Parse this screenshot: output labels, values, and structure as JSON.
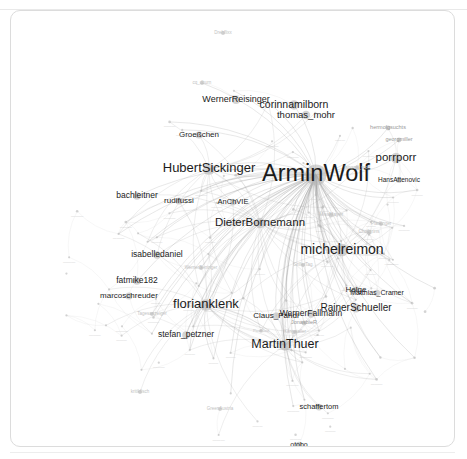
{
  "app": {
    "title": "Twitter mention network graph",
    "panel_name": "graph-canvas",
    "background_color": "#ffffff",
    "node_color": "#b9b9b9",
    "edge_color": "#8d8d8d",
    "label_color": "#1b1b1b",
    "border_color": "#dcdcdc"
  },
  "chart_data": {
    "type": "scatter",
    "subtype": "force-directed-network",
    "title": "",
    "subtitle": "",
    "xlabel": "",
    "ylabel": "",
    "grid": false,
    "legend": "none",
    "xlim": [
      0,
      443
    ],
    "ylim": [
      0,
      435
    ],
    "node_count": 148,
    "label_size_units": "px",
    "nodes": [
      {
        "id": "ArminWolf",
        "label": "ArminWolf",
        "x": 305,
        "y": 164,
        "size": 23.5,
        "tier": "major",
        "weight": 100
      },
      {
        "id": "michelreimon",
        "label": "michelreimon",
        "x": 331,
        "y": 239,
        "size": 14.0,
        "tier": "major",
        "weight": 72
      },
      {
        "id": "HubertSickinger",
        "label": "HubertSickinger",
        "x": 198,
        "y": 158,
        "size": 13.0,
        "tier": "major",
        "weight": 68
      },
      {
        "id": "florianklenk",
        "label": "florianklenk",
        "x": 195,
        "y": 294,
        "size": 13.0,
        "tier": "major",
        "weight": 67
      },
      {
        "id": "MartinThuer",
        "label": "MartinThuer",
        "x": 274,
        "y": 334,
        "size": 12.5,
        "tier": "major",
        "weight": 64
      },
      {
        "id": "DieterBornemann",
        "label": "DieterBornemann",
        "x": 249,
        "y": 212,
        "size": 11.5,
        "tier": "major",
        "weight": 58
      },
      {
        "id": "porrporr",
        "label": "porrporr",
        "x": 385,
        "y": 147,
        "size": 11.5,
        "tier": "major",
        "weight": 55
      },
      {
        "id": "corinnamilborn",
        "label": "corinnamilborn",
        "x": 283,
        "y": 94,
        "size": 10.5,
        "tier": "major",
        "weight": 53
      },
      {
        "id": "RainerSchueller",
        "label": "RainerSchueller",
        "x": 345,
        "y": 297,
        "size": 10.0,
        "tier": "major",
        "weight": 49
      },
      {
        "id": "thomas_mohr",
        "label": "thomas_mohr",
        "x": 295,
        "y": 104,
        "size": 9.5,
        "tier": "mid",
        "weight": 46
      },
      {
        "id": "WernerReisinger",
        "label": "WernerReisinger",
        "x": 225,
        "y": 89,
        "size": 9.0,
        "tier": "mid",
        "weight": 44
      },
      {
        "id": "WernerFallmann",
        "label": "WernerFallmann",
        "x": 300,
        "y": 303,
        "size": 8.5,
        "tier": "mid",
        "weight": 41
      },
      {
        "id": "isabelledaniel",
        "label": "isabelledaniel",
        "x": 146,
        "y": 244,
        "size": 8.5,
        "tier": "mid",
        "weight": 40
      },
      {
        "id": "fatmike182",
        "label": "fatmike182",
        "x": 126,
        "y": 270,
        "size": 8.5,
        "tier": "mid",
        "weight": 39
      },
      {
        "id": "bachleitner",
        "label": "bachleitner",
        "x": 126,
        "y": 185,
        "size": 8.5,
        "tier": "mid",
        "weight": 38
      },
      {
        "id": "stefan_petzner",
        "label": "stefan_petzner",
        "x": 175,
        "y": 324,
        "size": 8.5,
        "tier": "mid",
        "weight": 37
      },
      {
        "id": "marcoschreuder",
        "label": "marcoschreuder",
        "x": 118,
        "y": 285,
        "size": 8.0,
        "tier": "mid",
        "weight": 36
      },
      {
        "id": "Claus_Pandi",
        "label": "Claus_Pandi",
        "x": 265,
        "y": 305,
        "size": 8.0,
        "tier": "mid",
        "weight": 35
      },
      {
        "id": "Groessschen",
        "label": "Groeßchen",
        "x": 188,
        "y": 124,
        "size": 8.0,
        "tier": "mid",
        "weight": 34
      },
      {
        "id": "Matthias_Cramer",
        "label": "Matthias_Cramer",
        "x": 366,
        "y": 282,
        "size": 7.0,
        "tier": "mid",
        "weight": 30
      },
      {
        "id": "rudifussi",
        "label": "rudifussi",
        "x": 168,
        "y": 190,
        "size": 8.0,
        "tier": "mid",
        "weight": 33
      },
      {
        "id": "AnChVIE",
        "label": "AnChVIE",
        "x": 222,
        "y": 191,
        "size": 7.5,
        "tier": "mid",
        "weight": 32
      },
      {
        "id": "HansAttenovic",
        "label": "HansAttenovic",
        "x": 388,
        "y": 169,
        "size": 6.5,
        "tier": "mid",
        "weight": 28
      },
      {
        "id": "Helge",
        "label": "Helge",
        "x": 345,
        "y": 279,
        "size": 8.0,
        "tier": "mid",
        "weight": 31
      },
      {
        "id": "schaffertom",
        "label": "schaffertom",
        "x": 308,
        "y": 396,
        "size": 7.5,
        "tier": "mid",
        "weight": 27
      },
      {
        "id": "ototbo",
        "label": "otobo",
        "x": 288,
        "y": 434,
        "size": 7.0,
        "tier": "mid",
        "weight": 24
      },
      {
        "id": "JonasbieR",
        "label": "JonasbieR",
        "x": 293,
        "y": 312,
        "size": 5.5,
        "tier": "small",
        "weight": 20
      },
      {
        "id": "hermolgsuchts",
        "label": "hermolgsuchts",
        "x": 377,
        "y": 117,
        "size": 5.5,
        "tier": "small",
        "weight": 19
      },
      {
        "id": "georgmiller",
        "label": "georgmiller",
        "x": 388,
        "y": 129,
        "size": 5.5,
        "tier": "small",
        "weight": 18
      },
      {
        "id": "janosk_wolf",
        "label": "janosk_wolf",
        "x": 346,
        "y": 157,
        "size": 5.0,
        "tier": "small",
        "weight": 17
      },
      {
        "id": "MissMayer",
        "label": "MissMayer",
        "x": 320,
        "y": 204,
        "size": 5.0,
        "tier": "small",
        "weight": 16
      },
      {
        "id": "Chalgrins",
        "label": "Chalgrins",
        "x": 358,
        "y": 221,
        "size": 5.0,
        "tier": "small",
        "weight": 15
      },
      {
        "id": "Pfadfinger",
        "label": "Pfadfinger",
        "x": 370,
        "y": 213,
        "size": 4.5,
        "tier": "small",
        "weight": 14
      },
      {
        "id": "GrillerTag",
        "label": "GrillerTag",
        "x": 292,
        "y": 254,
        "size": 4.5,
        "tier": "small",
        "weight": 14
      },
      {
        "id": "Klingstaller",
        "label": "Klingstaller",
        "x": 284,
        "y": 321,
        "size": 4.5,
        "tier": "small",
        "weight": 13
      },
      {
        "id": "cq_dburn",
        "label": "cq_dburn",
        "x": 191,
        "y": 72,
        "size": 4.5,
        "tier": "small",
        "weight": 13
      },
      {
        "id": "Tagesanzeiger",
        "label": "Tagesanzeiger",
        "x": 141,
        "y": 303,
        "size": 4.5,
        "tier": "small",
        "weight": 12
      },
      {
        "id": "GreenAustria",
        "label": "GreenAustria",
        "x": 209,
        "y": 398,
        "size": 4.5,
        "tier": "small",
        "weight": 12
      },
      {
        "id": "kritikfisch",
        "label": "kritikfisch",
        "x": 129,
        "y": 381,
        "size": 4.5,
        "tier": "small",
        "weight": 11
      },
      {
        "id": "Drehflixx",
        "label": "Drehflixx",
        "x": 212,
        "y": 22,
        "size": 4.5,
        "tier": "small",
        "weight": 11
      },
      {
        "id": "WernerBeninger",
        "label": "WernerBeninger",
        "x": 190,
        "y": 257,
        "size": 4.5,
        "tier": "small",
        "weight": 11
      },
      {
        "id": "PaulRaul",
        "label": "PaulRaul",
        "x": 250,
        "y": 320,
        "size": 4.0,
        "tier": "small",
        "weight": 10
      }
    ],
    "edges_note": "dense force-directed mention network; the majority of edges radiate from the ArminWolf hub and from the central florianklenk / DieterBornemann cluster",
    "annotations": []
  }
}
